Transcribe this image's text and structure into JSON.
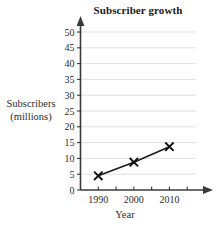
{
  "chart_data": {
    "type": "line",
    "title": "Subscriber growth",
    "xlabel": "Year",
    "ylabel_line1": "Subscribers",
    "ylabel_line2": "(millions)",
    "ylabel": "Subscribers (millions)",
    "x": [
      1990,
      2000,
      2010
    ],
    "values": [
      4.5,
      8.8,
      13.7
    ],
    "series": [
      {
        "name": "Subscribers",
        "values": [
          4.5,
          8.8,
          13.7
        ],
        "marker": "x",
        "color": "#111111"
      }
    ],
    "xlim": [
      1985,
      2020
    ],
    "ylim": [
      0,
      52
    ],
    "y_ticks": [
      0,
      5,
      10,
      15,
      20,
      25,
      30,
      35,
      40,
      45,
      50
    ],
    "y_tick_labels": [
      "0",
      "5",
      "10",
      "15",
      "20",
      "25",
      "30",
      "35",
      "40",
      "45",
      "50"
    ],
    "x_ticks_major": [
      1990,
      2000,
      2010
    ],
    "x_tick_labels": [
      "1990",
      "2000",
      "2010"
    ],
    "x_ticks_minor": [
      1990,
      1995,
      2000,
      2005,
      2010,
      2015
    ],
    "grid": "horizontal",
    "legend": "none",
    "axis_arrows": {
      "y_top": "arrow-up",
      "x_right": "arrow-right"
    },
    "colors": {
      "line": "#1d1d1d",
      "marker": "#111111",
      "grid": "#dcdcdc",
      "axis": "#3a3a3a",
      "text": "#2b2b2b",
      "background": "#ffffff"
    }
  }
}
